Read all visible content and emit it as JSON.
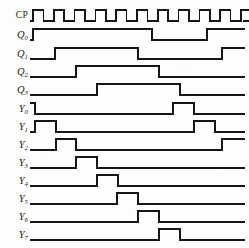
{
  "figure": {
    "kind": "digital-timing-diagram",
    "title": "",
    "line_color": "#161616",
    "background_color": "#fdfdfb",
    "width": 249,
    "height": 248
  },
  "axis": {
    "label_column_right_x": 30,
    "wave_start_x": 31,
    "wave_end_x": 244,
    "clock_period_px": 20.8,
    "clock_pulses": 12,
    "high_level_offset": 11,
    "low_level_offset": 0
  },
  "signals": [
    {
      "name": "CP",
      "label_text": "CP",
      "subscript": "",
      "italic": false,
      "row_baseline_y": 21,
      "type": "clock",
      "description": "free running clock, 12 pulses, 50% duty"
    },
    {
      "name": "Q0",
      "label_text": "Q",
      "subscript": "0",
      "italic": true,
      "row_baseline_y": 40,
      "type": "level",
      "transitions_px": [
        33,
        152,
        207
      ],
      "initial_state": 0,
      "description": "high from 33 to 152, high again from 207 to end"
    },
    {
      "name": "Q1",
      "label_text": "Q",
      "subscript": "1",
      "italic": true,
      "row_baseline_y": 59,
      "type": "level",
      "transitions_px": [
        55,
        138,
        222
      ],
      "initial_state": 0,
      "description": "high from 55 to 138, high again from 222 to end"
    },
    {
      "name": "Q2",
      "label_text": "Q",
      "subscript": "2",
      "italic": true,
      "row_baseline_y": 77,
      "type": "level",
      "transitions_px": [
        76,
        159
      ],
      "initial_state": 0,
      "description": "high from 76 to 159"
    },
    {
      "name": "Q3",
      "label_text": "Q",
      "subscript": "3",
      "italic": true,
      "row_baseline_y": 95,
      "type": "level",
      "transitions_px": [
        97,
        180
      ],
      "initial_state": 0,
      "description": "high from 97 to 180"
    },
    {
      "name": "Y0",
      "label_text": "Y",
      "subscript": "0",
      "italic": true,
      "row_baseline_y": 114,
      "type": "level",
      "transitions_px": [
        35,
        173,
        194
      ],
      "initial_state": 1,
      "description": "starts high, falls at 35, pulse high 173 to 194"
    },
    {
      "name": "Y1",
      "label_text": "Y",
      "subscript": "1",
      "italic": true,
      "row_baseline_y": 132,
      "type": "level",
      "transitions_px": [
        35,
        56,
        194,
        215
      ],
      "initial_state": 0,
      "description": "pulse 35-56 and pulse 194-215"
    },
    {
      "name": "Y2",
      "label_text": "Y",
      "subscript": "2",
      "italic": true,
      "row_baseline_y": 150,
      "type": "level",
      "transitions_px": [
        56,
        76,
        222
      ],
      "initial_state": 0,
      "description": "pulse 56-76, then high from 222 to end"
    },
    {
      "name": "Y3",
      "label_text": "Y",
      "subscript": "3",
      "italic": true,
      "row_baseline_y": 168,
      "type": "level",
      "transitions_px": [
        76,
        97
      ],
      "initial_state": 0,
      "description": "single pulse 76-97"
    },
    {
      "name": "Y4",
      "label_text": "Y",
      "subscript": "4",
      "italic": true,
      "row_baseline_y": 186,
      "type": "level",
      "transitions_px": [
        97,
        118
      ],
      "initial_state": 0,
      "description": "single pulse 97-118"
    },
    {
      "name": "Y5",
      "label_text": "Y",
      "subscript": "5",
      "italic": true,
      "row_baseline_y": 204,
      "type": "level",
      "transitions_px": [
        117,
        138
      ],
      "initial_state": 0,
      "description": "single pulse 117-138"
    },
    {
      "name": "Y6",
      "label_text": "Y",
      "subscript": "6",
      "italic": true,
      "row_baseline_y": 222,
      "type": "level",
      "transitions_px": [
        138,
        159
      ],
      "initial_state": 0,
      "description": "single pulse 138-159"
    },
    {
      "name": "Y7",
      "label_text": "Y",
      "subscript": "7",
      "italic": true,
      "row_baseline_y": 240,
      "type": "level",
      "transitions_px": [
        159,
        180
      ],
      "initial_state": 0,
      "description": "single pulse 159-180"
    }
  ],
  "chart_data": {
    "type": "line",
    "xlabel": "",
    "ylabel": "",
    "x_unit": "clock cycles",
    "clock_cycles": 12,
    "series": [
      {
        "name": "CP",
        "values": [
          1,
          0,
          1,
          0,
          1,
          0,
          1,
          0,
          1,
          0,
          1,
          0,
          1,
          0,
          1,
          0,
          1,
          0,
          1,
          0,
          1,
          0,
          1,
          0
        ]
      },
      {
        "name": "Q0",
        "values": [
          0,
          1,
          1,
          1,
          1,
          1,
          1,
          0,
          0,
          0,
          1,
          1
        ]
      },
      {
        "name": "Q1",
        "values": [
          0,
          0,
          1,
          1,
          1,
          1,
          0,
          0,
          0,
          0,
          0,
          1
        ]
      },
      {
        "name": "Q2",
        "values": [
          0,
          0,
          0,
          1,
          1,
          1,
          1,
          0,
          0,
          0,
          0,
          0
        ]
      },
      {
        "name": "Q3",
        "values": [
          0,
          0,
          0,
          0,
          1,
          1,
          1,
          1,
          0,
          0,
          0,
          0
        ]
      },
      {
        "name": "Y0",
        "values": [
          1,
          0,
          0,
          0,
          0,
          0,
          0,
          0,
          1,
          0,
          0,
          0
        ]
      },
      {
        "name": "Y1",
        "values": [
          0,
          1,
          0,
          0,
          0,
          0,
          0,
          0,
          0,
          1,
          0,
          0
        ]
      },
      {
        "name": "Y2",
        "values": [
          0,
          0,
          1,
          0,
          0,
          0,
          0,
          0,
          0,
          0,
          1,
          1
        ]
      },
      {
        "name": "Y3",
        "values": [
          0,
          0,
          0,
          1,
          0,
          0,
          0,
          0,
          0,
          0,
          0,
          0
        ]
      },
      {
        "name": "Y4",
        "values": [
          0,
          0,
          0,
          0,
          1,
          0,
          0,
          0,
          0,
          0,
          0,
          0
        ]
      },
      {
        "name": "Y5",
        "values": [
          0,
          0,
          0,
          0,
          0,
          1,
          0,
          0,
          0,
          0,
          0,
          0
        ]
      },
      {
        "name": "Y6",
        "values": [
          0,
          0,
          0,
          0,
          0,
          0,
          1,
          0,
          0,
          0,
          0,
          0
        ]
      },
      {
        "name": "Y7",
        "values": [
          0,
          0,
          0,
          0,
          0,
          0,
          0,
          1,
          0,
          0,
          0,
          0
        ]
      }
    ],
    "legend_position": "left-labels",
    "grid": false
  }
}
